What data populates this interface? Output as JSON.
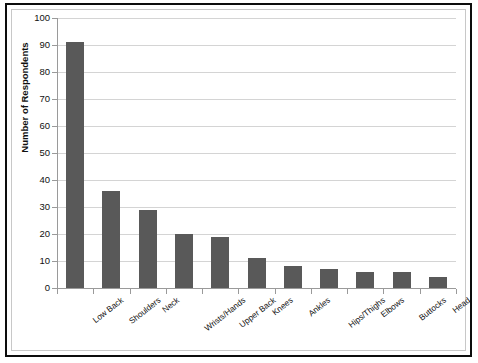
{
  "chart_data": {
    "type": "bar",
    "title": "",
    "xlabel": "",
    "ylabel": "Number of Respondents",
    "ylim": [
      0,
      100
    ],
    "ytick_step": 10,
    "yticks": [
      "100",
      "90",
      "80",
      "70",
      "60",
      "50",
      "40",
      "30",
      "20",
      "10",
      "0"
    ],
    "grid": "horizontal",
    "legend": "none",
    "bar_color": "#595959",
    "gridline_color": "#d4d4d4",
    "axis_color": "#9a9a9a",
    "categories": [
      "Low Back",
      "Shoulders",
      "Neck",
      "Wrists/Hands",
      "Upper Back",
      "Knees",
      "Ankles",
      "Hips/Thighs",
      "Elbows",
      "Buttocks",
      "Head"
    ],
    "values": [
      91,
      36,
      29,
      20,
      19,
      11,
      8,
      7,
      6,
      6,
      4
    ]
  }
}
